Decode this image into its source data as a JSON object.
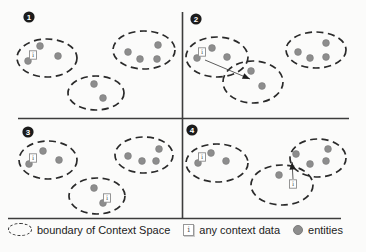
{
  "diagram": {
    "width": 366,
    "height": 252,
    "colors": {
      "background": "#fbfbfa",
      "entity_fill": "#8d8d8d",
      "entity_edge": "#7c7c7c",
      "boundary_stroke": "#2a2a2a",
      "divider_stroke": "#3c3c3c",
      "badge_fill": "#1b1b1b",
      "badge_text": "#ffffff",
      "arrow_stroke": "#4a4a4a",
      "arrowhead_fill": "#1e1e1e",
      "icon_fill": "#ffffff",
      "icon_border": "#8a8a8a",
      "icon_text": "#555555"
    },
    "context_data_glyph": "i",
    "dividers": [
      {
        "name": "vertical-divider",
        "x1": 182.5,
        "y1": 12,
        "x2": 182.5,
        "y2": 219
      },
      {
        "name": "horizontal-divider",
        "x1": 18,
        "y1": 118.5,
        "x2": 349,
        "y2": 118.5
      },
      {
        "name": "bottom-border",
        "x1": 8,
        "y1": 218.5,
        "x2": 341,
        "y2": 218.5
      }
    ],
    "panels": [
      {
        "number": "1",
        "badge": {
          "cx": 29,
          "cy": 17
        },
        "context_spaces": [
          {
            "cx": 47,
            "cy": 58,
            "rx": 30,
            "ry": 19
          },
          {
            "cx": 144,
            "cy": 50,
            "rx": 31,
            "ry": 19
          },
          {
            "cx": 96,
            "cy": 93,
            "rx": 28,
            "ry": 17
          }
        ],
        "entities": [
          [
            40,
            46
          ],
          [
            58,
            56
          ],
          [
            28,
            61
          ],
          [
            128,
            52
          ],
          [
            140,
            59
          ],
          [
            158,
            45
          ],
          [
            157,
            59
          ],
          [
            94,
            84
          ],
          [
            103,
            98
          ]
        ],
        "context_data": [
          [
            33,
            55
          ]
        ],
        "arrows": []
      },
      {
        "number": "2",
        "badge": {
          "cx": 196,
          "cy": 19
        },
        "context_spaces": [
          {
            "cx": 217,
            "cy": 57,
            "rx": 31,
            "ry": 20
          },
          {
            "cx": 253,
            "cy": 82,
            "rx": 30,
            "ry": 21
          },
          {
            "cx": 316,
            "cy": 50,
            "rx": 30,
            "ry": 18
          }
        ],
        "entities": [
          [
            212,
            48
          ],
          [
            227,
            57
          ],
          [
            197,
            58
          ],
          [
            251,
            71
          ],
          [
            262,
            86
          ],
          [
            298,
            52
          ],
          [
            310,
            58
          ],
          [
            326,
            43
          ],
          [
            326,
            57
          ]
        ],
        "context_data": [
          [
            202,
            52
          ]
        ],
        "arrows": [
          {
            "x1": 205,
            "y1": 60,
            "x2": 250,
            "y2": 79
          }
        ]
      },
      {
        "number": "3",
        "badge": {
          "cx": 28,
          "cy": 132
        },
        "context_spaces": [
          {
            "cx": 48,
            "cy": 160,
            "rx": 29,
            "ry": 19
          },
          {
            "cx": 144,
            "cy": 155,
            "rx": 29,
            "ry": 18
          },
          {
            "cx": 97,
            "cy": 196,
            "rx": 28,
            "ry": 18
          }
        ],
        "entities": [
          [
            43,
            151
          ],
          [
            59,
            160
          ],
          [
            29,
            164
          ],
          [
            128,
            156
          ],
          [
            142,
            161
          ],
          [
            159,
            149
          ],
          [
            156,
            161
          ],
          [
            94,
            188
          ],
          [
            103,
            203
          ]
        ],
        "context_data": [
          [
            33,
            158
          ],
          [
            107,
            198
          ]
        ],
        "arrows": []
      },
      {
        "number": "4",
        "badge": {
          "cx": 192,
          "cy": 130
        },
        "context_spaces": [
          {
            "cx": 217,
            "cy": 163,
            "rx": 31,
            "ry": 19
          },
          {
            "cx": 282,
            "cy": 185,
            "rx": 31,
            "ry": 20
          },
          {
            "cx": 318,
            "cy": 158,
            "rx": 28,
            "ry": 19
          }
        ],
        "entities": [
          [
            211,
            153
          ],
          [
            226,
            161
          ],
          [
            198,
            163
          ],
          [
            279,
            175
          ],
          [
            296,
            154
          ],
          [
            310,
            164
          ],
          [
            328,
            149
          ],
          [
            326,
            161
          ]
        ],
        "context_data": [
          [
            202,
            157
          ],
          [
            293,
            184
          ]
        ],
        "arrows": [
          {
            "x1": 293,
            "y1": 179,
            "x2": 292,
            "y2": 162
          }
        ]
      }
    ]
  },
  "legend": {
    "items": [
      {
        "id": "boundary",
        "label": "boundary of Context Space"
      },
      {
        "id": "context-data",
        "label": "any context data",
        "glyph": "i"
      },
      {
        "id": "entities",
        "label": "entities"
      }
    ]
  }
}
